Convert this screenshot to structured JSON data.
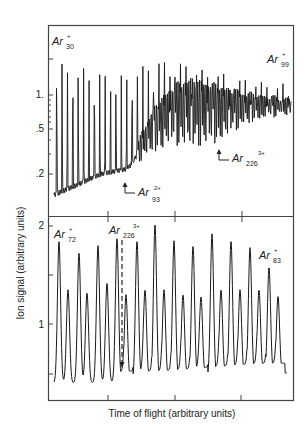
{
  "chart_data": [
    {
      "type": "line",
      "panel": "top",
      "yscale": "log",
      "ylabel": "Ion signal (arbitrary units)",
      "yticks": [
        {
          "label": "",
          "value": 2.0
        },
        {
          "label": "1.",
          "value": 1.0
        },
        {
          "label": ".5",
          "value": 0.5
        },
        {
          "label": ".2",
          "value": 0.2
        }
      ],
      "annotations": [
        {
          "text": "Ar",
          "sub": "30",
          "sup": "+",
          "pos": "top-left"
        },
        {
          "text": "Ar",
          "sub": "99",
          "sup": "+",
          "pos": "top-right"
        },
        {
          "text": "Ar",
          "sub": "93",
          "sup": "2+",
          "pos": "arrow, lower-middle"
        },
        {
          "text": "Ar",
          "sub": "226",
          "sup": "3+",
          "pos": "arrow, lower-right"
        }
      ],
      "description": "Dense comb of Ar cluster ion peaks: regular Ar_n+ peaks ~1.5-2.0 at left, onset of doubly charged series at Ar93 2+, triply charged series at Ar226 3+, envelope decreasing to ~0.8-1.2 at right",
      "envelope": {
        "x": [
          0,
          0.1,
          0.2,
          0.3,
          0.4,
          0.5,
          0.6,
          0.7,
          0.8,
          0.9,
          1.0
        ],
        "peak_top": [
          1.9,
          1.8,
          1.6,
          1.5,
          2.0,
          2.1,
          1.8,
          1.6,
          1.4,
          1.3,
          1.2
        ],
        "baseline": [
          0.13,
          0.16,
          0.2,
          0.22,
          0.3,
          0.38,
          0.35,
          0.4,
          0.55,
          0.65,
          0.7
        ]
      }
    },
    {
      "type": "line",
      "panel": "bottom",
      "yscale": "linear",
      "xlabel": "Time of flight (arbitrary units)",
      "ylabel": "Ion signal (arbitrary units)",
      "yticks": [
        {
          "label": "2",
          "value": 2.0
        },
        {
          "label": "",
          "value": 1.5
        },
        {
          "label": "1",
          "value": 1.0
        },
        {
          "label": "",
          "value": 0.5
        }
      ],
      "ylim": [
        0.35,
        2.05
      ],
      "annotations": [
        {
          "text": "Ar",
          "sub": "72",
          "sup": "+",
          "pos": "top-left"
        },
        {
          "text": "Ar",
          "sub": "226",
          "sup": "3+",
          "pos": "dashed arrow"
        },
        {
          "text": "Ar",
          "sub": "83",
          "sup": "+",
          "pos": "right"
        }
      ],
      "peaks_x": [
        59,
        68,
        79,
        87,
        98,
        107,
        117,
        126,
        137,
        145,
        155,
        164,
        174,
        183,
        193,
        201,
        212,
        221,
        231,
        240,
        250,
        259,
        269,
        278
      ],
      "peaks_value": [
        1.85,
        1.35,
        1.73,
        1.32,
        1.8,
        1.42,
        1.88,
        1.3,
        1.85,
        1.35,
        2.02,
        1.35,
        1.85,
        1.3,
        1.8,
        1.28,
        1.92,
        1.35,
        1.85,
        1.35,
        1.78,
        1.35,
        1.58,
        1.28
      ],
      "baseline_value": [
        0.4,
        0.4,
        0.4,
        0.42,
        0.42,
        0.44,
        0.46,
        0.48,
        0.5,
        0.5
      ]
    }
  ],
  "labels": {
    "ylabel": "Ion signal (arbitrary units)",
    "xlabel": "Time of flight (arbitrary units)",
    "top": {
      "tick_1": "1.",
      "tick_05": ".5",
      "tick_02": ".2",
      "ar30": {
        "base": "Ar",
        "sub": "30",
        "sup": "+"
      },
      "ar99": {
        "base": "Ar",
        "sub": "99",
        "sup": "+"
      },
      "ar93": {
        "base": "Ar",
        "sub": "93",
        "sup": "2+"
      },
      "ar226": {
        "base": "Ar",
        "sub": "226",
        "sup": "3+"
      }
    },
    "bottom": {
      "tick_2": "2",
      "tick_1": "1",
      "ar72": {
        "base": "Ar",
        "sub": "72",
        "sup": "+"
      },
      "ar226": {
        "base": "Ar",
        "sub": "226",
        "sup": "3+"
      },
      "ar83": {
        "base": "Ar",
        "sub": "83",
        "sup": "+"
      }
    }
  }
}
